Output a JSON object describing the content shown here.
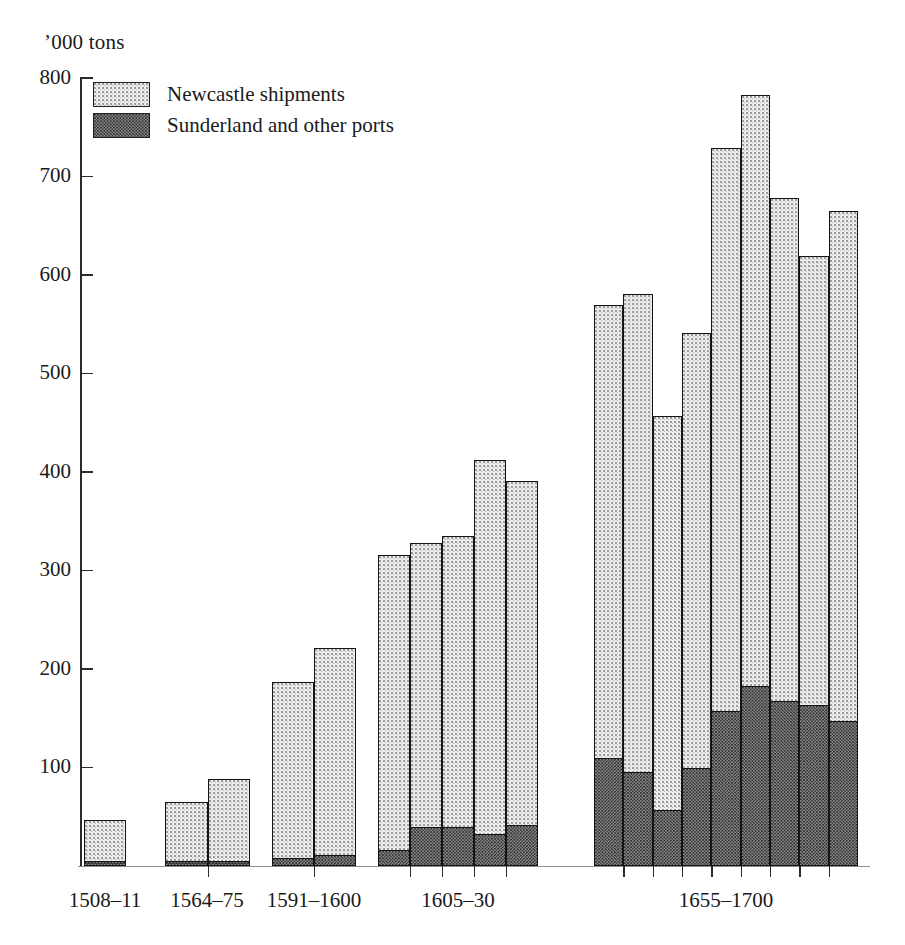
{
  "axis": {
    "unit_caption": "’000 tons",
    "y_ticks": [
      800,
      700,
      600,
      500,
      400,
      300,
      200,
      100
    ],
    "y_min": 0,
    "y_max": 800
  },
  "legend": {
    "items": [
      {
        "label": "Newcastle shipments",
        "swatch": "light-stipple",
        "color": "#ececec"
      },
      {
        "label": "Sunderland and other ports",
        "swatch": "dark-stipple",
        "color": "#8d8d8d"
      }
    ]
  },
  "chart_data": {
    "type": "bar",
    "title": "",
    "subtitle": "",
    "xlabel": "",
    "ylabel": "’000 tons",
    "ylim": [
      0,
      800
    ],
    "grid": false,
    "legend_position": "upper-left-inside",
    "stacked": true,
    "series": [
      {
        "name": "Sunderland and other ports",
        "values": [
          5,
          5,
          5,
          8,
          11,
          16,
          40,
          40,
          33,
          42,
          110,
          95,
          57,
          100,
          157,
          183,
          168,
          163,
          147
        ]
      },
      {
        "name": "Newcastle shipments",
        "values": [
          42,
          60,
          83,
          179,
          210,
          300,
          288,
          295,
          379,
          349,
          460,
          486,
          400,
          441,
          572,
          600,
          510,
          456,
          518
        ]
      }
    ],
    "totals": [
      47,
      65,
      88,
      187,
      221,
      316,
      328,
      335,
      412,
      391,
      570,
      581,
      457,
      541,
      729,
      783,
      678,
      619,
      665
    ],
    "groups": [
      {
        "label": "1508–11",
        "bars": [
          {
            "total": 47,
            "newcastle": 42,
            "sunderland": 5
          }
        ]
      },
      {
        "label": "1564–75",
        "bars": [
          {
            "total": 65,
            "newcastle": 60,
            "sunderland": 5
          },
          {
            "total": 88,
            "newcastle": 83,
            "sunderland": 5
          }
        ]
      },
      {
        "label": "1591–1600",
        "bars": [
          {
            "total": 187,
            "newcastle": 179,
            "sunderland": 8
          },
          {
            "total": 221,
            "newcastle": 210,
            "sunderland": 11
          }
        ]
      },
      {
        "label": "1605–30",
        "bars": [
          {
            "total": 316,
            "newcastle": 300,
            "sunderland": 16
          },
          {
            "total": 328,
            "newcastle": 288,
            "sunderland": 40
          },
          {
            "total": 335,
            "newcastle": 295,
            "sunderland": 40
          },
          {
            "total": 412,
            "newcastle": 379,
            "sunderland": 33
          },
          {
            "total": 391,
            "newcastle": 349,
            "sunderland": 42
          }
        ]
      },
      {
        "label": "1655–1700",
        "bars": [
          {
            "total": 570,
            "newcastle": 460,
            "sunderland": 110
          },
          {
            "total": 581,
            "newcastle": 486,
            "sunderland": 95
          },
          {
            "total": 457,
            "newcastle": 400,
            "sunderland": 57
          },
          {
            "total": 541,
            "newcastle": 441,
            "sunderland": 100
          },
          {
            "total": 729,
            "newcastle": 572,
            "sunderland": 157
          },
          {
            "total": 783,
            "newcastle": 600,
            "sunderland": 183
          },
          {
            "total": 678,
            "newcastle": 510,
            "sunderland": 168
          },
          {
            "total": 619,
            "newcastle": 456,
            "sunderland": 163
          },
          {
            "total": 665,
            "newcastle": 518,
            "sunderland": 147
          }
        ]
      }
    ]
  },
  "layout": {
    "group_spans": [
      {
        "x0": 84,
        "x1": 126
      },
      {
        "x0": 165,
        "x1": 250
      },
      {
        "x0": 272,
        "x1": 356
      },
      {
        "x0": 378,
        "x1": 538
      },
      {
        "x0": 594,
        "x1": 858
      }
    ],
    "label_centers": [
      105,
      207,
      314,
      458,
      726
    ]
  }
}
